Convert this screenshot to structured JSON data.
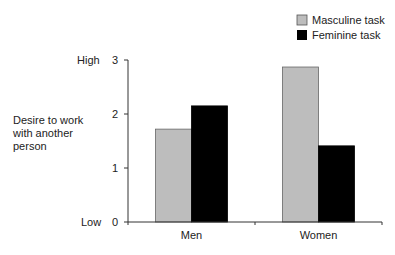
{
  "chart_data": {
    "type": "bar",
    "title": "",
    "categories": [
      "Men",
      "Women"
    ],
    "series": [
      {
        "name": "Masculine task",
        "color": "#bdbdbd",
        "values": [
          1.72,
          2.87
        ]
      },
      {
        "name": "Feminine task",
        "color": "#000000",
        "values": [
          2.15,
          1.41
        ]
      }
    ],
    "ylabel": "Desire to work with another person",
    "ylabel_lines": [
      "Desire to work",
      "with another",
      "person"
    ],
    "ylim": [
      0,
      3
    ],
    "yticks": [
      "0",
      "1",
      "2",
      "3"
    ],
    "y_anchor_labels": {
      "high": "High",
      "low": "Low"
    },
    "xlabel": "",
    "grid": false,
    "legend_position": "top-right"
  }
}
